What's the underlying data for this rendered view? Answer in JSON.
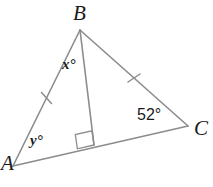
{
  "figure": {
    "type": "geometry-diagram",
    "shape": "triangle",
    "stroke_color": "#8c8c8c",
    "text_color": "#1a1a1a",
    "background_color": "#ffffff"
  },
  "vertices": {
    "B": {
      "label": "B",
      "x": 80,
      "y": 30
    },
    "A": {
      "label": "A",
      "x": 13,
      "y": 166
    },
    "C": {
      "label": "C",
      "x": 188,
      "y": 126
    },
    "D": {
      "label": "",
      "x": 94,
      "y": 145
    }
  },
  "sides": [
    {
      "name": "AB",
      "from": "A",
      "to": "B",
      "tick_marks": 1
    },
    {
      "name": "BC",
      "from": "B",
      "to": "C",
      "tick_marks": 1
    },
    {
      "name": "AC",
      "from": "A",
      "to": "C",
      "tick_marks": 0
    },
    {
      "name": "BD",
      "from": "B",
      "to": "D",
      "tick_marks": 0,
      "role": "altitude"
    }
  ],
  "angles": [
    {
      "name": "angle-at-B-left",
      "label": "x°",
      "value": "x",
      "unit": "degrees",
      "at_vertex": "B"
    },
    {
      "name": "angle-at-A",
      "label": "y°",
      "value": "y",
      "unit": "degrees",
      "at_vertex": "A"
    },
    {
      "name": "angle-at-C",
      "label": "52°",
      "value": "52",
      "unit": "degrees",
      "at_vertex": "C"
    },
    {
      "name": "right-angle-at-D",
      "label": "",
      "value": "90",
      "unit": "degrees",
      "at_vertex": "D",
      "marker": "square"
    }
  ]
}
